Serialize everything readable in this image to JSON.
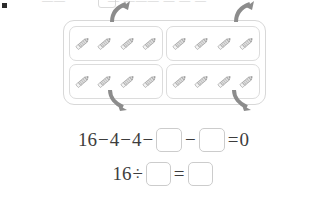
{
  "page": {
    "kind": "math-worksheet-problem",
    "background_color": "#ffffff"
  },
  "top_strip": {
    "bullet_icon": "square-bullet-icon",
    "bullet_color": "#2b2b2b",
    "ghost_text_a": "——",
    "ghost_text_b": "— ——— — — —",
    "note": "clipped previous line"
  },
  "visual": {
    "total_items": 16,
    "group_count": 4,
    "items_per_group": 4,
    "item_icon": "pencil-icon",
    "outer_border_color": "#d8d8d8",
    "group_border_color": "#dcdcdc",
    "arrow_color": "#8c8c8c",
    "arrows": [
      {
        "name": "arrow-top-left",
        "direction": "up-right"
      },
      {
        "name": "arrow-top-right",
        "direction": "up-right"
      },
      {
        "name": "arrow-bottom-left",
        "direction": "down-right"
      },
      {
        "name": "arrow-bottom-right",
        "direction": "down-right"
      }
    ],
    "groups": [
      {
        "label": "group-1",
        "items": [
          "pencil",
          "pencil",
          "pencil",
          "pencil"
        ]
      },
      {
        "label": "group-2",
        "items": [
          "pencil",
          "pencil",
          "pencil",
          "pencil"
        ]
      },
      {
        "label": "group-3",
        "items": [
          "pencil",
          "pencil",
          "pencil",
          "pencil"
        ]
      },
      {
        "label": "group-4",
        "items": [
          "pencil",
          "pencil",
          "pencil",
          "pencil"
        ]
      }
    ]
  },
  "equations": [
    {
      "name": "subtraction-equation",
      "tokens": [
        {
          "type": "number",
          "text": "16"
        },
        {
          "type": "operator",
          "text": "−"
        },
        {
          "type": "number",
          "text": "4"
        },
        {
          "type": "operator",
          "text": "−"
        },
        {
          "type": "number",
          "text": "4"
        },
        {
          "type": "operator",
          "text": "−"
        },
        {
          "type": "blank",
          "text": ""
        },
        {
          "type": "operator",
          "text": "−"
        },
        {
          "type": "blank",
          "text": ""
        },
        {
          "type": "operator",
          "text": "="
        },
        {
          "type": "number",
          "text": "0"
        }
      ]
    },
    {
      "name": "division-equation",
      "tokens": [
        {
          "type": "number",
          "text": "16"
        },
        {
          "type": "operator",
          "text": "÷"
        },
        {
          "type": "blank",
          "text": ""
        },
        {
          "type": "operator",
          "text": "="
        },
        {
          "type": "blank",
          "text": ""
        }
      ]
    }
  ],
  "colors": {
    "text": "#3d3d3d",
    "blank_border": "#cccccc",
    "pencil_body": "#d9d9d9",
    "pencil_outline": "#8f8f8f",
    "pencil_tip": "#4a4a4a"
  }
}
